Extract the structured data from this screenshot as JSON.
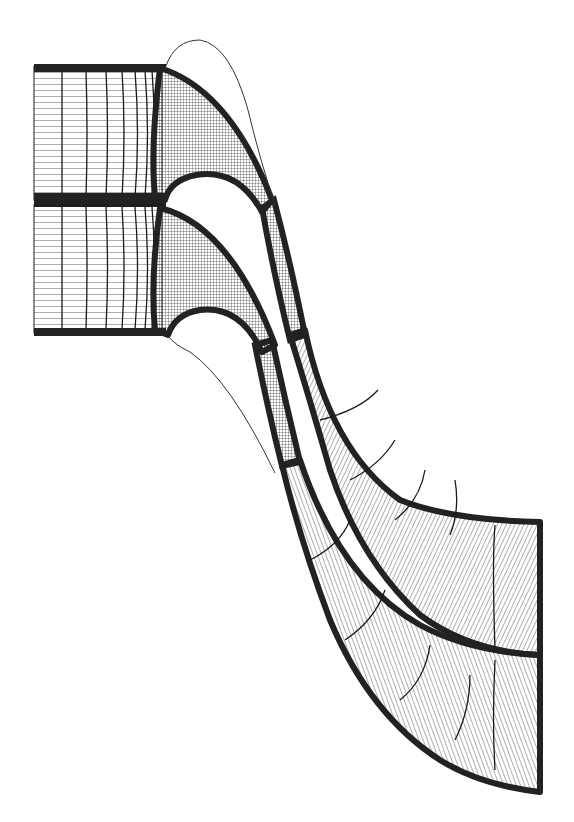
{
  "diagram": {
    "type": "structured multi-block computational mesh",
    "subject": "two-passage turbine blade cascade grid",
    "colors": {
      "background": "#ffffff",
      "mesh_line": "#1a1a1a",
      "dense_band": "#222222",
      "blade_outline": "#333333"
    },
    "blocks": [
      {
        "name": "inlet-block-upper",
        "kind": "H-grid rectangle"
      },
      {
        "name": "inlet-block-lower",
        "kind": "H-grid rectangle"
      },
      {
        "name": "leading-edge-block-upper",
        "kind": "C-grid curved"
      },
      {
        "name": "leading-edge-block-lower",
        "kind": "C-grid curved"
      },
      {
        "name": "throat-block-upper",
        "kind": "narrow passage"
      },
      {
        "name": "throat-block-lower",
        "kind": "narrow passage"
      },
      {
        "name": "outlet-block-upper",
        "kind": "curved diffusing passage"
      },
      {
        "name": "outlet-block-lower",
        "kind": "curved diffusing passage"
      }
    ],
    "blades": [
      {
        "name": "blade-upper",
        "outline": "thin line airfoil"
      },
      {
        "name": "blade-lower",
        "outline": "thin line airfoil"
      }
    ]
  }
}
